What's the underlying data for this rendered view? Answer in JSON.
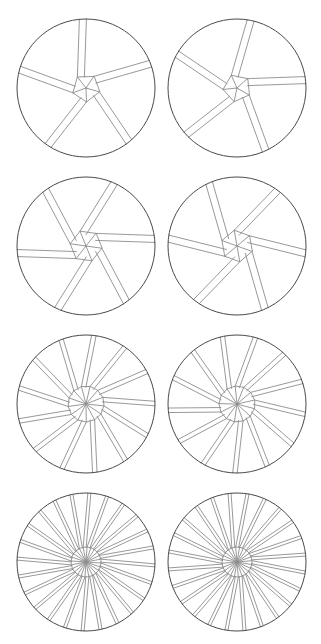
{
  "figure": {
    "background_color": "#ffffff",
    "outline_color": "#4a4a4a",
    "line_color": "#8d8d8d",
    "canvas": {
      "width": 321,
      "height": 644
    },
    "rows": [
      {
        "row_label": "row-1",
        "top": 8,
        "arms": 5,
        "core_radius": 14,
        "core_sides": 5,
        "twist_deg": 40,
        "rotation_deg": 16,
        "band_offset": 7,
        "show_core_polygon": true,
        "cells": [
          {
            "cell_label": "figure-1a",
            "center_x": 81,
            "center_y": 80,
            "radius": 69,
            "phase_deg": 0
          },
          {
            "cell_label": "figure-1b",
            "center_x": 81,
            "center_y": 80,
            "radius": 69,
            "phase_deg": 14
          }
        ]
      },
      {
        "row_label": "row-2",
        "top": 166,
        "arms": 6,
        "core_radius": 16,
        "core_sides": 6,
        "twist_deg": 54,
        "rotation_deg": 8,
        "band_offset": 7,
        "show_core_polygon": true,
        "cells": [
          {
            "cell_label": "figure-2a",
            "center_x": 81,
            "center_y": 80,
            "radius": 69,
            "phase_deg": 0
          },
          {
            "cell_label": "figure-2b",
            "center_x": 81,
            "center_y": 80,
            "radius": 69,
            "phase_deg": 12
          }
        ]
      },
      {
        "row_label": "row-3",
        "top": 324,
        "arms": 13,
        "core_radius": 18,
        "core_sides": 13,
        "twist_deg": 26,
        "rotation_deg": 6,
        "band_offset": 4.5,
        "show_core_polygon": true,
        "cells": [
          {
            "cell_label": "figure-3a",
            "center_x": 81,
            "center_y": 80,
            "radius": 69,
            "phase_deg": 0
          },
          {
            "cell_label": "figure-3b",
            "center_x": 81,
            "center_y": 80,
            "radius": 69,
            "phase_deg": 9
          }
        ]
      },
      {
        "row_label": "row-4",
        "top": 482,
        "arms": 24,
        "core_radius": 15,
        "core_sides": 24,
        "twist_deg": 16,
        "rotation_deg": 4,
        "band_offset": 3,
        "show_core_polygon": true,
        "cells": [
          {
            "cell_label": "figure-4a",
            "center_x": 81,
            "center_y": 80,
            "radius": 69,
            "phase_deg": 0
          },
          {
            "cell_label": "figure-4b",
            "center_x": 81,
            "center_y": 80,
            "radius": 69,
            "phase_deg": 6
          }
        ]
      }
    ]
  }
}
